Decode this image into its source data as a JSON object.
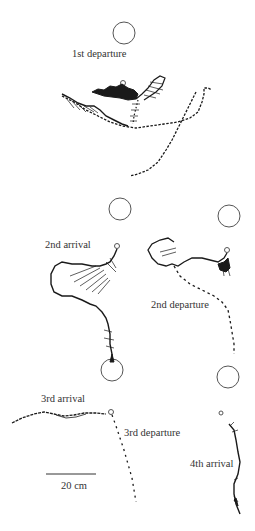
{
  "figure": {
    "panels": [
      {
        "id": "p1",
        "label": "1st departure",
        "label_pos": [
          72,
          49
        ],
        "target": [
          124,
          33
        ],
        "start": [
          123,
          83
        ]
      },
      {
        "id": "p2",
        "label": "2nd arrival",
        "label_pos": [
          45,
          61
        ],
        "target": [
          120,
          209
        ],
        "start": [
          117,
          246
        ]
      },
      {
        "id": "p3",
        "label": "2nd departure",
        "label_pos": [
          151,
          300
        ],
        "target": [
          229,
          216
        ],
        "start": [
          227,
          250
        ]
      },
      {
        "id": "p4",
        "label": "3rd arrival",
        "label_pos": [
          41,
          394
        ],
        "target": [
          112,
          370
        ],
        "start": [
          111,
          412
        ]
      },
      {
        "id": "p5",
        "label": "3rd departure",
        "label_pos": [
          124,
          428
        ],
        "target": [
          112,
          370
        ],
        "start": [
          111,
          412
        ]
      },
      {
        "id": "p6",
        "label": "4th arrival",
        "label_pos": [
          190,
          459
        ],
        "target": [
          228,
          377
        ],
        "start": [
          221,
          413
        ]
      }
    ],
    "scale_bar": {
      "label": "20 cm",
      "length_px": 50
    },
    "ink_color": "#1a1a1a",
    "text_color": "#333333"
  }
}
